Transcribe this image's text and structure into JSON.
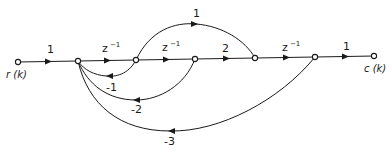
{
  "diagram": {
    "type": "signal-flow-graph",
    "input_label": "r (k)",
    "output_label": "c (k)",
    "nodes": [
      {
        "id": "r",
        "label": "r (k)"
      },
      {
        "id": "n1"
      },
      {
        "id": "n2"
      },
      {
        "id": "n3"
      },
      {
        "id": "n4"
      },
      {
        "id": "n5"
      },
      {
        "id": "c",
        "label": "c (k)"
      }
    ],
    "forward_gains": {
      "r_n1": "1",
      "n1_n2": "z",
      "n1_n2_exp": "−1",
      "n2_n3": "z",
      "n2_n3_exp": "−1",
      "n3_n4": "2",
      "n4_n5": "z",
      "n4_n5_exp": "−1",
      "n5_c": "1",
      "n2_n4_feedforward": "1"
    },
    "feedback_gains": {
      "n2_n1": "-1",
      "n3_n1": "-2",
      "n5_n1": "-3"
    },
    "colors": {
      "stroke": "#1a1a1a",
      "background": "#ffffff"
    }
  }
}
